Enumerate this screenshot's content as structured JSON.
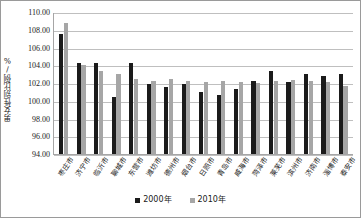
{
  "chart_data": {
    "type": "bar",
    "title": "",
    "xlabel": "",
    "ylabel": "男女性别比例/%",
    "ylim": [
      94.0,
      110.0
    ],
    "ytick_step": 2.0,
    "ytick_labels": [
      "110.00",
      "108.00",
      "106.00",
      "104.00",
      "102.00",
      "100.00",
      "98.00",
      "96.00",
      "94.00"
    ],
    "ytick_values": [
      110.0,
      108.0,
      106.0,
      104.0,
      102.0,
      100.0,
      98.0,
      96.0,
      94.0
    ],
    "grid": true,
    "legend_position": "bottom-center",
    "categories": [
      "枣庄市",
      "济宁市",
      "临沂市",
      "聊城市",
      "东营市",
      "潍坊市",
      "德州市",
      "烟台市",
      "日照市",
      "青岛市",
      "威海市",
      "菏泽市",
      "莱芜市",
      "滨州市",
      "济南市",
      "淄博市",
      "泰安市"
    ],
    "series": [
      {
        "name": "2000年",
        "color": "#1b1b1b",
        "values": [
          107.5,
          104.3,
          104.2,
          100.4,
          104.2,
          101.9,
          101.5,
          101.9,
          101.0,
          100.7,
          101.3,
          102.2,
          103.3,
          102.1,
          103.0,
          102.8,
          103.0
        ]
      },
      {
        "name": "2010年",
        "color": "#a6a6a6",
        "values": [
          108.8,
          104.0,
          103.3,
          103.0,
          102.5,
          102.2,
          102.4,
          102.2,
          102.1,
          102.2,
          102.1,
          102.0,
          102.2,
          102.3,
          102.2,
          102.1,
          101.7
        ]
      }
    ]
  },
  "legend": {
    "entries": [
      {
        "label": "2000年",
        "swatch": "black-square"
      },
      {
        "label": "2010年",
        "swatch": "gray-square"
      }
    ]
  },
  "colors": {
    "series_2000": "#1b1b1b",
    "series_2010": "#a6a6a6",
    "gridline": "#bfbfbf",
    "axis": "#a6a6a6",
    "frame": "#9a9a9a",
    "background": "#ffffff"
  }
}
